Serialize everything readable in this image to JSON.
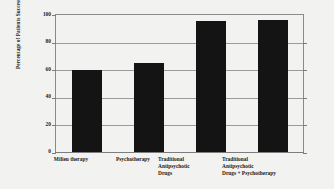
{
  "chart_data": {
    "type": "bar",
    "title": "",
    "xlabel": "",
    "ylabel": "Percentage of Patients Successfully Treated",
    "categories": [
      "Milieu therapy",
      "Psychotherapy",
      "Traditional Antipsychotic Drugs",
      "Traditional Antipsychotic Drugs + Psychotherapy"
    ],
    "category_lines": [
      [
        "Milieu therapy"
      ],
      [
        "Psychotherapy"
      ],
      [
        "Traditional",
        "Antipsychotic",
        "Drugs"
      ],
      [
        "Traditional",
        "Antipsychotic",
        "Drugs + Psychotherapy"
      ]
    ],
    "values": [
      60,
      65,
      96,
      96.5
    ],
    "ylim": [
      0,
      100
    ],
    "ytick_labels": [
      "100",
      "80",
      "60",
      "40",
      "20",
      "0"
    ],
    "ytick_values": [
      100,
      80,
      60,
      40,
      20,
      0
    ],
    "grid": true,
    "legend": "none",
    "bar_color": "#141414",
    "background_color": "#f2f2f0",
    "axis_color": "#8a8a8a"
  }
}
